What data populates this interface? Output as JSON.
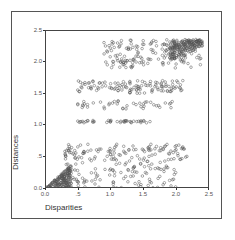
{
  "chart_data": {
    "type": "scatter",
    "title": "",
    "xlabel": "Disparities",
    "ylabel": "Distances",
    "xlim": [
      0,
      2.5
    ],
    "ylim": [
      0,
      2.5
    ],
    "xticks": [
      "0.0",
      ".5",
      "1.0",
      "1.5",
      "2.0",
      "2.5"
    ],
    "yticks": [
      "0.0",
      ".5",
      "1.0",
      "1.5",
      "2.0",
      "2.5"
    ],
    "grid": false,
    "legend": null,
    "marker": "open-circle",
    "marker_color": "#555555",
    "clusters": [
      {
        "name": "low-dense-wedge",
        "x_range": [
          0.0,
          0.4
        ],
        "y_range": [
          0.0,
          0.35
        ],
        "density": "very high"
      },
      {
        "name": "low-band",
        "x_range": [
          0.3,
          2.0
        ],
        "y_range": [
          0.0,
          0.45
        ],
        "density": "medium"
      },
      {
        "name": "band-0.6",
        "x_range": [
          0.3,
          2.2
        ],
        "y_range": [
          0.45,
          0.7
        ],
        "density": "medium"
      },
      {
        "name": "band-1.05",
        "x_range": [
          0.5,
          1.6
        ],
        "y_range": [
          1.03,
          1.07
        ],
        "density": "low"
      },
      {
        "name": "band-1.3",
        "x_range": [
          0.5,
          2.0
        ],
        "y_range": [
          1.25,
          1.38
        ],
        "density": "low"
      },
      {
        "name": "band-1.6",
        "x_range": [
          0.5,
          2.1
        ],
        "y_range": [
          1.5,
          1.7
        ],
        "density": "medium"
      },
      {
        "name": "upper-band",
        "x_range": [
          0.9,
          2.4
        ],
        "y_range": [
          1.9,
          2.35
        ],
        "density": "high"
      },
      {
        "name": "upper-right-dense-wedge",
        "x_range": [
          1.9,
          2.4
        ],
        "y_range": [
          2.0,
          2.35
        ],
        "density": "very high"
      }
    ],
    "sample_points": [
      [
        0.05,
        0.02
      ],
      [
        0.1,
        0.05
      ],
      [
        0.15,
        0.1
      ],
      [
        0.2,
        0.15
      ],
      [
        0.25,
        0.2
      ],
      [
        0.3,
        0.25
      ],
      [
        0.35,
        0.3
      ],
      [
        0.12,
        0.02
      ],
      [
        0.22,
        0.05
      ],
      [
        0.3,
        0.08
      ],
      [
        0.6,
        0.1
      ],
      [
        0.8,
        0.2
      ],
      [
        1.0,
        0.3
      ],
      [
        1.2,
        0.15
      ],
      [
        1.4,
        0.25
      ],
      [
        1.6,
        0.1
      ],
      [
        1.8,
        0.05
      ],
      [
        1.9,
        0.12
      ],
      [
        0.35,
        0.62
      ],
      [
        0.5,
        0.65
      ],
      [
        0.7,
        0.6
      ],
      [
        1.0,
        0.58
      ],
      [
        1.2,
        0.66
      ],
      [
        1.5,
        0.6
      ],
      [
        1.8,
        0.62
      ],
      [
        2.0,
        0.67
      ],
      [
        2.1,
        0.65
      ],
      [
        0.55,
        1.05
      ],
      [
        0.75,
        1.05
      ],
      [
        1.0,
        1.05
      ],
      [
        1.1,
        1.05
      ],
      [
        1.2,
        1.05
      ],
      [
        1.4,
        1.05
      ],
      [
        1.6,
        1.05
      ],
      [
        0.5,
        1.33
      ],
      [
        0.6,
        1.33
      ],
      [
        0.9,
        1.28
      ],
      [
        1.1,
        1.33
      ],
      [
        1.25,
        1.3
      ],
      [
        1.5,
        1.33
      ],
      [
        1.7,
        1.3
      ],
      [
        1.9,
        1.33
      ],
      [
        0.5,
        1.55
      ],
      [
        0.7,
        1.6
      ],
      [
        1.0,
        1.65
      ],
      [
        1.2,
        1.6
      ],
      [
        1.4,
        1.55
      ],
      [
        1.6,
        1.65
      ],
      [
        1.8,
        1.6
      ],
      [
        2.0,
        1.6
      ],
      [
        0.9,
        2.3
      ],
      [
        1.1,
        2.1
      ],
      [
        1.3,
        2.2
      ],
      [
        1.5,
        2.0
      ],
      [
        1.7,
        2.25
      ],
      [
        1.8,
        1.95
      ],
      [
        2.0,
        2.1
      ],
      [
        2.2,
        2.3
      ],
      [
        2.3,
        2.35
      ],
      [
        2.35,
        2.33
      ]
    ]
  }
}
